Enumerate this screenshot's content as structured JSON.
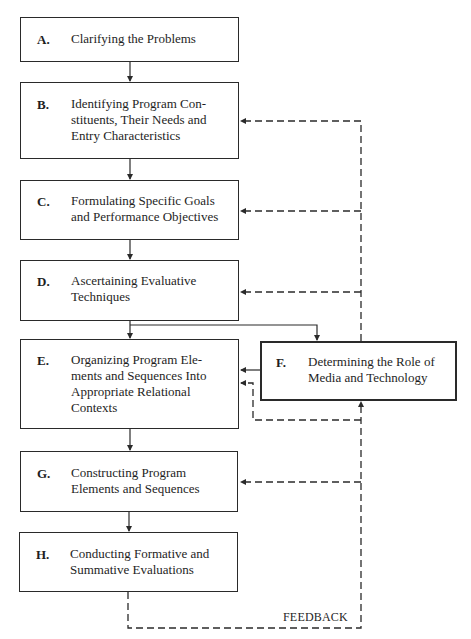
{
  "diagram": {
    "steps": [
      {
        "id": "A",
        "letter": "A.",
        "label": "Clarifying the Problems"
      },
      {
        "id": "B",
        "letter": "B.",
        "label": "Identifying Program Con-\nstituents, Their Needs and\nEntry Characteristics"
      },
      {
        "id": "C",
        "letter": "C.",
        "label": "Formulating Specific Goals\nand Performance Objectives"
      },
      {
        "id": "D",
        "letter": "D.",
        "label": "Ascertaining Evaluative\nTechniques"
      },
      {
        "id": "E",
        "letter": "E.",
        "label": "Organizing Program Ele-\nments and Sequences Into\nAppropriate Relational\nContexts"
      },
      {
        "id": "F",
        "letter": "F.",
        "label": "Determining the Role of\nMedia and Technology"
      },
      {
        "id": "G",
        "letter": "G.",
        "label": "Constructing Program\nElements and Sequences"
      },
      {
        "id": "H",
        "letter": "H.",
        "label": "Conducting Formative and\nSummative Evaluations"
      }
    ],
    "feedback_label": "FEEDBACK",
    "flow": [
      [
        "A",
        "B"
      ],
      [
        "B",
        "C"
      ],
      [
        "C",
        "D"
      ],
      [
        "D",
        "E"
      ],
      [
        "D",
        "F"
      ],
      [
        "F",
        "E"
      ],
      [
        "E",
        "G"
      ],
      [
        "G",
        "H"
      ]
    ],
    "feedback_targets": [
      "B",
      "C",
      "D",
      "E",
      "F",
      "G"
    ],
    "colors": {
      "line": "#2a2a2a",
      "background": "#ffffff"
    }
  }
}
